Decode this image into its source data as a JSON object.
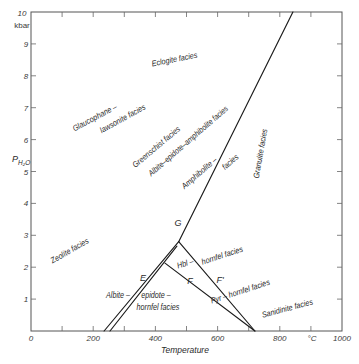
{
  "diagram": {
    "type": "phase-diagram",
    "plot_box_px": {
      "left": 31,
      "top": 12,
      "right": 342,
      "bottom": 331
    },
    "x_range": [
      0,
      1000
    ],
    "y_range": [
      0,
      10
    ],
    "colors": {
      "line": "#1a1a1a",
      "frame": "#555555",
      "text": "#2a2a2a",
      "background": "#ffffff"
    },
    "boundaries": [
      {
        "name": "main-boundary",
        "points": [
          [
            842,
            10
          ],
          [
            475,
            2.8
          ]
        ]
      },
      {
        "name": "E-outer-boundary",
        "points": [
          [
            475,
            2.8
          ],
          [
            235,
            0
          ]
        ]
      },
      {
        "name": "E-inner-boundary",
        "points": [
          [
            469,
            2.66
          ],
          [
            254,
            0
          ]
        ]
      },
      {
        "name": "F-boundary",
        "points": [
          [
            431,
            2.13
          ],
          [
            720,
            0
          ]
        ]
      },
      {
        "name": "F-prime-boundary",
        "points": [
          [
            475,
            2.8
          ],
          [
            720,
            0
          ]
        ]
      }
    ],
    "points": {
      "G": "G",
      "E": "E",
      "F": "F",
      "F_prime": "F'"
    }
  },
  "axes": {
    "x": {
      "label": "Temperature",
      "unit": "°C",
      "tick_labels": [
        "0",
        "200",
        "400",
        "600",
        "800",
        "1000"
      ],
      "tick_values": [
        0,
        200,
        400,
        600,
        800,
        1000
      ],
      "minor_ticks": [
        100,
        200,
        300,
        400,
        500,
        600,
        700,
        800,
        900
      ]
    },
    "y": {
      "label_main": "P",
      "label_sub": "H₂O",
      "unit": "kbar",
      "top_label": "10",
      "tick_labels": [
        "1",
        "2",
        "3",
        "4",
        "5",
        "6",
        "7",
        "8",
        "9"
      ],
      "tick_values": [
        1,
        2,
        3,
        4,
        5,
        6,
        7,
        8,
        9
      ]
    },
    "origin_label": "0"
  },
  "facies": {
    "eclogite": "Eclogite facies",
    "glaucophane_1": "Glaucophane –",
    "glaucophane_2": "lawsonite facies",
    "greenschist": "Greenschist facies",
    "albite_epidote_amphibolite": "Albite–epidote–amphibolite facies",
    "amphibolite_1": "Amphibolite –",
    "amphibolite_2": "facies",
    "granulite": "Granulite facies",
    "zeolite": "Zeolite facies",
    "hbl_1": "Hbl –",
    "hbl_2": "hornfel facies",
    "pyr": "Pyr – hornfel facies",
    "albite_epidote_hornfels_1": "Albite –",
    "albite_epidote_hornfels_2": "epidote –",
    "albite_epidote_hornfels_3": "hornfel facies",
    "sanidinite": "Sanidinite facies"
  }
}
